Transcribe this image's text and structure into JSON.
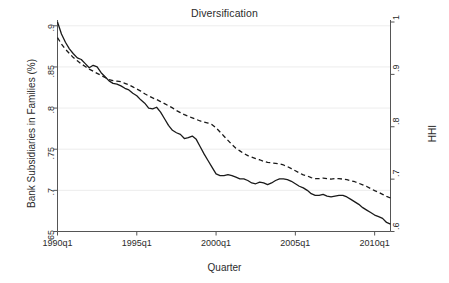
{
  "chart": {
    "title": "Diversification",
    "xlabel": "Quarter",
    "ylabel_left": "Bank Subsidiaries in Families (%)",
    "ylabel_right": "HHI"
  },
  "chart_data": {
    "type": "line",
    "title": "Diversification",
    "xlabel": "Quarter",
    "ylabel": "Bank Subsidiaries in Families (%)",
    "ylabel_secondary": "HHI",
    "grid": true,
    "legend": "none",
    "xlim": [
      "1990q1",
      "2011q1"
    ],
    "xticks": [
      "1990q1",
      "1995q1",
      "2000q1",
      "2005q1",
      "2010q1"
    ],
    "xtick_values": [
      1990.0,
      1995.0,
      2000.0,
      2005.0,
      2010.0
    ],
    "ylim": [
      0.65,
      0.9046
    ],
    "yticks": [
      0.65,
      0.7,
      0.75,
      0.8,
      0.85,
      0.9
    ],
    "ytick_labels": [
      ".65",
      ".7",
      ".75",
      ".8",
      ".85",
      ".9"
    ],
    "ylim_secondary": [
      0.6,
      1.0
    ],
    "yticks_secondary": [
      0.6,
      0.7,
      0.8,
      0.9,
      1.0
    ],
    "ytick_labels_secondary": [
      ".6",
      ".7",
      ".8",
      ".9",
      "1"
    ],
    "x": [
      1990.0,
      1990.25,
      1990.5,
      1990.75,
      1991.0,
      1991.25,
      1991.5,
      1991.75,
      1992.0,
      1992.25,
      1992.5,
      1992.75,
      1993.0,
      1993.25,
      1993.5,
      1993.75,
      1994.0,
      1994.25,
      1994.5,
      1994.75,
      1995.0,
      1995.25,
      1995.5,
      1995.75,
      1996.0,
      1996.25,
      1996.5,
      1996.75,
      1997.0,
      1997.25,
      1997.5,
      1997.75,
      1998.0,
      1998.25,
      1998.5,
      1998.75,
      1999.0,
      1999.25,
      1999.5,
      1999.75,
      2000.0,
      2000.25,
      2000.5,
      2000.75,
      2001.0,
      2001.25,
      2001.5,
      2001.75,
      2002.0,
      2002.25,
      2002.5,
      2002.75,
      2003.0,
      2003.25,
      2003.5,
      2003.75,
      2004.0,
      2004.25,
      2004.5,
      2004.75,
      2005.0,
      2005.25,
      2005.5,
      2005.75,
      2006.0,
      2006.25,
      2006.5,
      2006.75,
      2007.0,
      2007.25,
      2007.5,
      2007.75,
      2008.0,
      2008.25,
      2008.5,
      2008.75,
      2009.0,
      2009.25,
      2009.5,
      2009.75,
      2010.0,
      2010.25,
      2010.5,
      2010.75,
      2011.0
    ],
    "series": [
      {
        "name": "Bank Subsidiaries in Families (%)",
        "axis": "left",
        "style": "solid",
        "color": "#1a1a1a",
        "values": [
          0.9046,
          0.89,
          0.88,
          0.872,
          0.866,
          0.861,
          0.859,
          0.854,
          0.849,
          0.852,
          0.85,
          0.843,
          0.838,
          0.833,
          0.83,
          0.829,
          0.827,
          0.824,
          0.822,
          0.818,
          0.815,
          0.81,
          0.806,
          0.8,
          0.799,
          0.801,
          0.795,
          0.787,
          0.779,
          0.773,
          0.77,
          0.768,
          0.763,
          0.764,
          0.766,
          0.762,
          0.753,
          0.744,
          0.736,
          0.728,
          0.72,
          0.718,
          0.718,
          0.719,
          0.718,
          0.716,
          0.714,
          0.714,
          0.712,
          0.709,
          0.708,
          0.71,
          0.709,
          0.707,
          0.709,
          0.712,
          0.714,
          0.714,
          0.713,
          0.711,
          0.708,
          0.705,
          0.703,
          0.7,
          0.696,
          0.694,
          0.694,
          0.695,
          0.693,
          0.692,
          0.693,
          0.694,
          0.694,
          0.692,
          0.689,
          0.686,
          0.683,
          0.679,
          0.676,
          0.673,
          0.67,
          0.668,
          0.666,
          0.661,
          0.659
        ]
      },
      {
        "name": "HHI",
        "axis": "right",
        "style": "dashed",
        "color": "#1a1a1a",
        "values": [
          0.97,
          0.958,
          0.948,
          0.94,
          0.932,
          0.926,
          0.92,
          0.915,
          0.91,
          0.906,
          0.902,
          0.898,
          0.894,
          0.89,
          0.888,
          0.887,
          0.886,
          0.883,
          0.88,
          0.876,
          0.872,
          0.868,
          0.863,
          0.859,
          0.855,
          0.852,
          0.848,
          0.844,
          0.84,
          0.836,
          0.831,
          0.827,
          0.823,
          0.82,
          0.817,
          0.814,
          0.811,
          0.809,
          0.807,
          0.804,
          0.798,
          0.79,
          0.782,
          0.774,
          0.766,
          0.759,
          0.754,
          0.749,
          0.745,
          0.742,
          0.739,
          0.737,
          0.734,
          0.732,
          0.731,
          0.73,
          0.729,
          0.727,
          0.724,
          0.72,
          0.716,
          0.712,
          0.708,
          0.706,
          0.703,
          0.701,
          0.701,
          0.702,
          0.701,
          0.7,
          0.701,
          0.701,
          0.7,
          0.699,
          0.697,
          0.695,
          0.692,
          0.689,
          0.686,
          0.682,
          0.678,
          0.675,
          0.671,
          0.667,
          0.664
        ]
      }
    ]
  },
  "axis_ticks": {
    "left": [
      ".9",
      ".85",
      ".8",
      ".75",
      ".7",
      ".65"
    ],
    "right": [
      "1",
      ".9",
      ".8",
      ".7",
      ".6"
    ],
    "bottom": [
      "1990q1",
      "1995q1",
      "2000q1",
      "2005q1",
      "2010q1"
    ]
  }
}
